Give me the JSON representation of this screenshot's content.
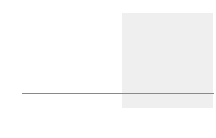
{
  "chart_data": {
    "type": "bar",
    "subtype": "stacked-bar",
    "title": "",
    "ylabel": "Billion people",
    "xlabel": "",
    "ylim": [
      -0.2,
      1.0
    ],
    "ytick_labels": [
      "1.0",
      "0.8",
      "0.6",
      "0.4",
      "0.2",
      "0",
      "-0.2"
    ],
    "ytick_values": [
      1.0,
      0.8,
      0.6,
      0.4,
      0.2,
      0,
      -0.2
    ],
    "grid": true,
    "legend": "none",
    "categories": [
      "1980",
      "1990",
      "2000",
      "2010",
      "2020",
      "2030",
      "2040",
      "2050",
      "2060",
      "2070"
    ],
    "series": [
      {
        "name": "segment-base",
        "color": "#000000",
        "values": [
          0.08,
          0.08,
          0.07,
          0.065,
          0.06,
          0.05,
          0.04,
          0.03,
          0.02,
          0.01
        ]
      },
      {
        "name": "segment-middle",
        "color": "#2b2b2b",
        "values": [
          0.62,
          0.71,
          0.64,
          0.605,
          0.61,
          0.49,
          0.38,
          0.26,
          0.155,
          0.075
        ]
      },
      {
        "name": "segment-top",
        "color": "#9e9e9e",
        "values": [
          0.1,
          0.08,
          0.11,
          0.14,
          0.16,
          0.21,
          0.23,
          0.25,
          0.245,
          0.235
        ]
      }
    ],
    "totals": [
      0.8,
      0.87,
      0.82,
      0.81,
      0.83,
      0.75,
      0.65,
      0.54,
      0.42,
      0.32
    ],
    "forecast_region": {
      "label": "",
      "start_category": "2030",
      "end_category": "2070",
      "shade_color": "#efefef"
    }
  },
  "colors": {
    "background": "#ffffff",
    "text": "#1a1a1a",
    "axis": "#8a8a8a",
    "forecast_shade": "#efefef"
  }
}
